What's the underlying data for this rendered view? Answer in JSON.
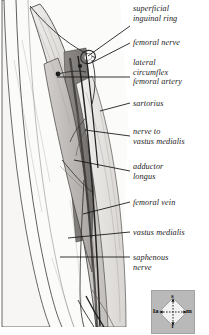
{
  "figure": {
    "type": "anatomical-illustration",
    "style": "grayscale pen-and-ink dissection drawing",
    "region": "right anterior thigh, femoral triangle and adductor canal"
  },
  "labels": [
    {
      "id": "superficial-inguinal-ring",
      "text": "superficial\ninguinal ring",
      "x": 133,
      "y": 4,
      "leader": {
        "x1": 130,
        "y1": 26,
        "x2": 88,
        "y2": 56
      }
    },
    {
      "id": "femoral-nerve",
      "text": "femoral nerve",
      "x": 133,
      "y": 38,
      "leader": {
        "x1": 130,
        "y1": 43,
        "x2": 93,
        "y2": 62
      }
    },
    {
      "id": "lateral-circumflex-femoral-artery",
      "text": "lateral\ncircumflex\nfemoral artery",
      "x": 133,
      "y": 58,
      "leader": {
        "x1": 130,
        "y1": 77,
        "x2": 57,
        "y2": 77
      }
    },
    {
      "id": "sartorius",
      "text": "sartorius",
      "x": 133,
      "y": 99,
      "leader": {
        "x1": 130,
        "y1": 103,
        "x2": 100,
        "y2": 111
      }
    },
    {
      "id": "nerve-to-vastus-medialis",
      "text": "nerve to\nvastus medialis",
      "x": 133,
      "y": 127,
      "leader": {
        "x1": 130,
        "y1": 136,
        "x2": 85,
        "y2": 130
      }
    },
    {
      "id": "adductor-longus",
      "text": "adductor\nlongus",
      "x": 133,
      "y": 162,
      "leader": {
        "x1": 130,
        "y1": 171,
        "x2": 74,
        "y2": 160
      }
    },
    {
      "id": "femoral-vein",
      "text": "femoral vein",
      "x": 133,
      "y": 198,
      "leader": {
        "x1": 130,
        "y1": 202,
        "x2": 83,
        "y2": 214
      }
    },
    {
      "id": "vastus-medialis",
      "text": "vastus medialis",
      "x": 133,
      "y": 228,
      "leader": {
        "x1": 130,
        "y1": 232,
        "x2": 68,
        "y2": 238
      }
    },
    {
      "id": "saphenous-nerve",
      "text": "saphenous\nnerve",
      "x": 133,
      "y": 253,
      "leader": {
        "x1": 130,
        "y1": 257,
        "x2": 60,
        "y2": 257
      }
    }
  ],
  "compass": {
    "id": "orientation-compass",
    "box": {
      "x": 151,
      "y": 290,
      "w": 42,
      "h": 42
    },
    "superior": "s",
    "inferior": "i",
    "lateral": "la",
    "medial": "m"
  },
  "colors": {
    "background": "#ffffff",
    "ink": "#1a1a1a",
    "leader": "#111111",
    "compass_bg": "#b9b9b9",
    "muscle_light": "#e3e1df",
    "muscle_mid": "#c9c6c3",
    "muscle_dark": "#9a9794",
    "vessel_dark": "#4a4846"
  }
}
